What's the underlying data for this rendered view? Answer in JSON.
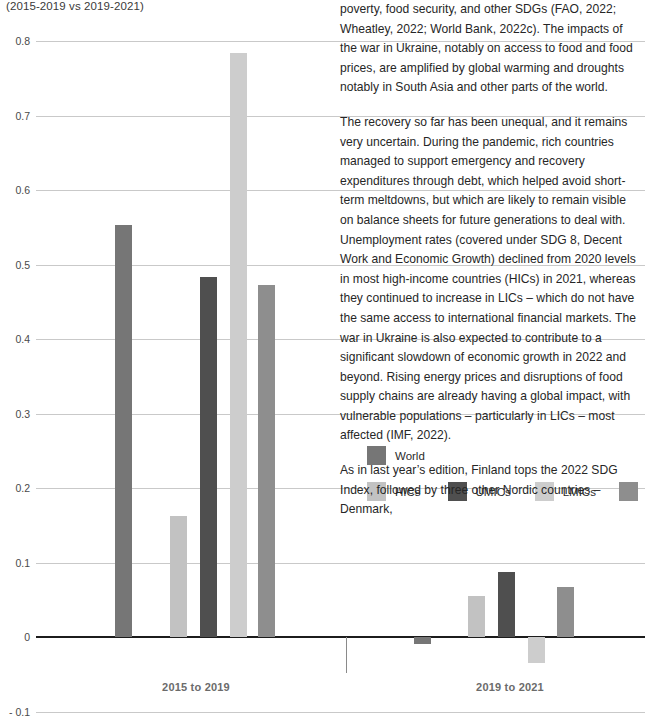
{
  "chart_data": {
    "type": "bar",
    "title": "",
    "subtitle": "(2015-2019 vs 2019-2021)",
    "xlabel": "",
    "ylabel": "",
    "categories": [
      "2015 to 2019",
      "2019 to 2021"
    ],
    "ylim": [
      -0.1,
      0.8
    ],
    "yticks": [
      "0.8",
      "0.7",
      "0.6",
      "0.5",
      "0.4",
      "0.3",
      "0.2",
      "0.1",
      "0",
      "- 0.1"
    ],
    "ytick_values": [
      0.8,
      0.7,
      0.6,
      0.5,
      0.4,
      0.3,
      0.2,
      0.1,
      0,
      -0.1
    ],
    "grid": true,
    "legend_position": "inside-right",
    "series": [
      {
        "name": "World",
        "color": "#767676",
        "values": [
          0.553,
          -0.009
        ]
      },
      {
        "name": "HICs",
        "color": "#c2c2c2",
        "values": [
          0.162,
          0.055
        ]
      },
      {
        "name": "UMICs",
        "color": "#4f4f4f",
        "values": [
          0.483,
          0.087
        ]
      },
      {
        "name": "LMICs",
        "color": "#cdcdcd",
        "values": [
          0.784,
          -0.035
        ]
      },
      {
        "name": "LICs",
        "color": "#8e8e8e",
        "values": [
          0.473,
          0.067
        ]
      }
    ]
  },
  "legend": {
    "row1": [
      {
        "label": "World",
        "color": "#767676"
      }
    ],
    "row2": [
      {
        "label": "HICs",
        "color": "#c2c2c2"
      },
      {
        "label": "UMICs",
        "color": "#4f4f4f"
      },
      {
        "label": "LMICs",
        "color": "#cdcdcd"
      },
      {
        "label": "LICs",
        "color": "#8e8e8e"
      }
    ]
  },
  "text_column": {
    "paragraphs": [
      "poverty, food security, and other SDGs (FAO, 2022; Wheatley, 2022; World Bank, 2022c). The impacts of the war in Ukraine, notably on access to food and food prices, are amplified by global warming and droughts notably in South Asia and other parts of the world.",
      "The recovery so far has been unequal, and it remains very uncertain. During the pandemic, rich countries managed to support emergency and recovery expenditures through debt, which helped avoid short-term meltdowns, but which are likely to remain visible on balance sheets for future generations to deal with. Unemployment rates (covered under SDG 8, Decent Work and Economic Growth) declined from 2020 levels in most high-income countries (HICs) in 2021, whereas they continued to increase in LICs – which do not have the same access to international financial markets. The war in Ukraine is also expected to contribute to a significant slowdown of economic growth in 2022 and beyond. Rising energy prices and disruptions of food supply chains are already having a global impact, with vulnerable populations – particularly in LICs – most affected (IMF, 2022).",
      "As in last year’s edition, Finland tops the 2022 SDG Index, followed by three other Nordic countries – Denmark,"
    ]
  }
}
